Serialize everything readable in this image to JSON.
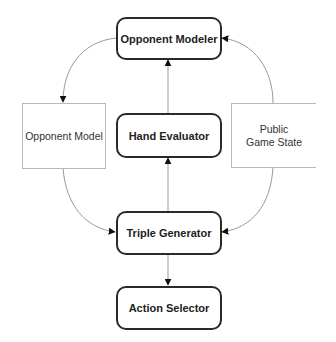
{
  "diagram": {
    "nodes": [
      {
        "id": "opponent_modeler",
        "label": "Opponent Modeler",
        "kind": "process"
      },
      {
        "id": "opponent_model",
        "label": "Opponent Model",
        "kind": "data"
      },
      {
        "id": "hand_evaluator",
        "label": "Hand Evaluator",
        "kind": "process"
      },
      {
        "id": "public_game_state",
        "label": "Public Game State",
        "kind": "data"
      },
      {
        "id": "triple_generator",
        "label": "Triple Generator",
        "kind": "process"
      },
      {
        "id": "action_selector",
        "label": "Action Selector",
        "kind": "process"
      }
    ],
    "edges": [
      {
        "from": "opponent_modeler",
        "to": "opponent_model"
      },
      {
        "from": "hand_evaluator",
        "to": "opponent_modeler"
      },
      {
        "from": "public_game_state",
        "to": "opponent_modeler"
      },
      {
        "from": "opponent_model",
        "to": "triple_generator"
      },
      {
        "from": "triple_generator",
        "to": "hand_evaluator"
      },
      {
        "from": "public_game_state",
        "to": "triple_generator"
      },
      {
        "from": "triple_generator",
        "to": "action_selector"
      }
    ],
    "colors": {
      "process_border": "#2a2a2a",
      "data_border": "#b8b8b8",
      "edge": "#888888"
    }
  }
}
